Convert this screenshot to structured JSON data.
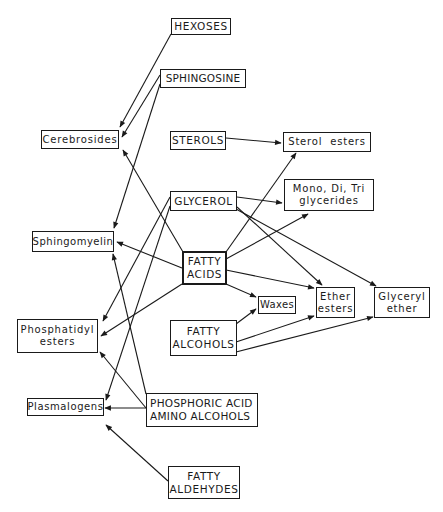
{
  "diagram": {
    "nodes": {
      "hexoses": {
        "lines": [
          "HEXOSES"
        ]
      },
      "sphingosine": {
        "lines": [
          "SPHINGOSINE"
        ]
      },
      "cerebrosides": {
        "lines": [
          "Cerebrosides"
        ]
      },
      "sterols": {
        "lines": [
          "STEROLS"
        ]
      },
      "sterol_esters": {
        "lines": [
          "Sterol  esters"
        ]
      },
      "glycerol": {
        "lines": [
          "GLYCEROL"
        ]
      },
      "glycerides": {
        "lines": [
          "Mono, Di, Tri",
          "glycerides"
        ]
      },
      "sphingomyelin": {
        "lines": [
          "Sphingomyelin"
        ]
      },
      "fatty_acids": {
        "lines": [
          "FATTY",
          "ACIDS"
        ]
      },
      "waxes": {
        "lines": [
          "Waxes"
        ]
      },
      "ether_esters": {
        "lines": [
          "Ether",
          "esters"
        ]
      },
      "glyceryl_ether": {
        "lines": [
          "Glyceryl",
          "ether"
        ]
      },
      "fatty_alcohols": {
        "lines": [
          "FATTY",
          "ALCOHOLS"
        ]
      },
      "phosphatidyl_esters": {
        "lines": [
          "Phosphatidyl",
          "esters"
        ]
      },
      "plasmalogens": {
        "lines": [
          "Plasmalogens"
        ]
      },
      "phosphoric_acid": {
        "lines": [
          "PHOSPHORIC ACID",
          "AMINO ALCOHOLS"
        ]
      },
      "fatty_aldehydes": {
        "lines": [
          "FATTY",
          "ALDEHYDES"
        ]
      }
    },
    "edges": [
      {
        "from": "HEXOSES",
        "to": "Cerebrosides"
      },
      {
        "from": "SPHINGOSINE",
        "to": "Cerebrosides"
      },
      {
        "from": "SPHINGOSINE",
        "to": "Sphingomyelin"
      },
      {
        "from": "STEROLS",
        "to": "Sterol esters"
      },
      {
        "from": "FATTY ACIDS",
        "to": "Cerebrosides"
      },
      {
        "from": "FATTY ACIDS",
        "to": "Sterol esters"
      },
      {
        "from": "FATTY ACIDS",
        "to": "Mono, Di, Tri glycerides"
      },
      {
        "from": "FATTY ACIDS",
        "to": "Sphingomyelin"
      },
      {
        "from": "FATTY ACIDS",
        "to": "Phosphatidyl esters"
      },
      {
        "from": "FATTY ACIDS",
        "to": "Waxes"
      },
      {
        "from": "FATTY ACIDS",
        "to": "Ether esters"
      },
      {
        "from": "GLYCEROL",
        "to": "Mono, Di, Tri glycerides"
      },
      {
        "from": "GLYCEROL",
        "to": "Ether esters"
      },
      {
        "from": "GLYCEROL",
        "to": "Glyceryl ether"
      },
      {
        "from": "GLYCEROL",
        "to": "Phosphatidyl esters"
      },
      {
        "from": "GLYCEROL",
        "to": "Plasmalogens"
      },
      {
        "from": "FATTY ALCOHOLS",
        "to": "Waxes"
      },
      {
        "from": "FATTY ALCOHOLS",
        "to": "Ether esters"
      },
      {
        "from": "FATTY ALCOHOLS",
        "to": "Glyceryl ether"
      },
      {
        "from": "PHOSPHORIC ACID AMINO ALCOHOLS",
        "to": "Sphingomyelin"
      },
      {
        "from": "PHOSPHORIC ACID AMINO ALCOHOLS",
        "to": "Phosphatidyl esters"
      },
      {
        "from": "PHOSPHORIC ACID AMINO ALCOHOLS",
        "to": "Plasmalogens"
      },
      {
        "from": "FATTY ALDEHYDES",
        "to": "Plasmalogens"
      }
    ]
  }
}
